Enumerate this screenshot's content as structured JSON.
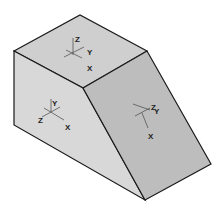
{
  "diagram": {
    "colors": {
      "top_face": "#cfcfcf",
      "left_face": "#d6d6d6",
      "slope_face": "#bdbdbd",
      "edge": "#1a1a1a",
      "axis": "#555555"
    },
    "faces": [
      {
        "name": "top-face",
        "axes": {
          "z": "Z",
          "y": "Y",
          "x": "X"
        }
      },
      {
        "name": "front-face",
        "axes": {
          "y": "Y",
          "z": "Z",
          "x": "X"
        }
      },
      {
        "name": "slope-face",
        "axes": {
          "z": "Z",
          "y": "Y",
          "x": "X"
        }
      }
    ]
  }
}
